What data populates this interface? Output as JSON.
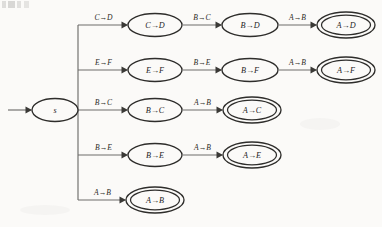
{
  "diagram": {
    "type": "finite-state-automaton",
    "background_color": "#fbfaf8",
    "node_stroke_color": "#2e2d2b",
    "edge_stroke_color": "#6e6d6b",
    "start_state": {
      "id": "s",
      "label": "s",
      "accepting": false,
      "cx": 55,
      "cy": 110,
      "rx": 23,
      "ry": 11.5
    },
    "rows": [
      {
        "row_index": 0,
        "cy": 25,
        "branch_label": "C→D",
        "nodes": [
          {
            "label": "C→D",
            "cx": 155,
            "rx": 27,
            "ry": 11.5,
            "accepting": false
          },
          {
            "label": "B→D",
            "cx": 250,
            "rx": 28,
            "ry": 11.5,
            "accepting": false
          },
          {
            "label": "A→D",
            "cx": 346,
            "rx": 29,
            "ry": 13,
            "accepting": true
          }
        ],
        "edge_labels": [
          "B→C",
          "A→B"
        ]
      },
      {
        "row_index": 1,
        "cy": 70,
        "branch_label": "E→F",
        "nodes": [
          {
            "label": "E→F",
            "cx": 155,
            "rx": 27,
            "ry": 11.5,
            "accepting": false
          },
          {
            "label": "B→F",
            "cx": 250,
            "rx": 28,
            "ry": 11.5,
            "accepting": false
          },
          {
            "label": "A→F",
            "cx": 346,
            "rx": 29,
            "ry": 13,
            "accepting": true
          }
        ],
        "edge_labels": [
          "B→E",
          "A→B"
        ]
      },
      {
        "row_index": 2,
        "cy": 110,
        "branch_label": "B→C",
        "nodes": [
          {
            "label": "B→C",
            "cx": 155,
            "rx": 27,
            "ry": 11.5,
            "accepting": false
          },
          {
            "label": "A→C",
            "cx": 252,
            "rx": 29,
            "ry": 13,
            "accepting": true
          }
        ],
        "edge_labels": [
          "A→B"
        ]
      },
      {
        "row_index": 3,
        "cy": 155,
        "branch_label": "B→E",
        "nodes": [
          {
            "label": "B→E",
            "cx": 155,
            "rx": 27,
            "ry": 11.5,
            "accepting": false
          },
          {
            "label": "A→E",
            "cx": 252,
            "rx": 29,
            "ry": 13,
            "accepting": true
          }
        ],
        "edge_labels": [
          "A→B"
        ]
      },
      {
        "row_index": 4,
        "cy": 200,
        "branch_label": "A→B",
        "nodes": [
          {
            "label": "A→B",
            "cx": 155,
            "rx": 29,
            "ry": 13,
            "accepting": true
          }
        ],
        "edge_labels": []
      }
    ],
    "spine": {
      "x": 78,
      "y_top": 25,
      "y_bottom": 200
    },
    "start_arrow": {
      "x_from": 8,
      "x_to": 31,
      "y": 110
    }
  }
}
